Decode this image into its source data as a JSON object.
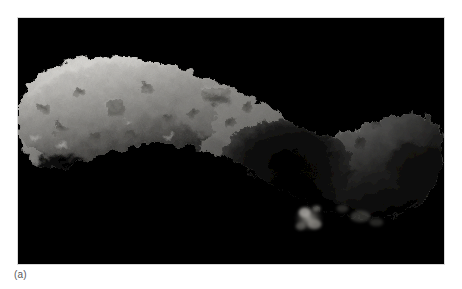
{
  "figure": {
    "caption_label": "(a)",
    "frame": {
      "x": 17,
      "y": 17,
      "width": 428,
      "height": 248,
      "background_color": "#000000",
      "border_color": "#d9d9d9"
    },
    "colors": {
      "page_background": "#ffffff",
      "space_background": "#000000",
      "caption_text": "#58585a",
      "regolith_bright": "#d8d6d2",
      "regolith_midtone": "#9a9894",
      "regolith_shadow": "#3a3937",
      "crater_rim_highlight": "#efeeea",
      "terminator_dark": "#0a0a0a"
    },
    "body_outline": {
      "description": "Elongated peanut shape spanning nearly the full frame width, widest at left, tapering and bending through a central saddle, rounded lobe at right",
      "leftmost_x": 0,
      "rightmost_x": 428,
      "top_y": 38,
      "bottom_y": 200
    },
    "features": [
      {
        "name": "large-crater-right-lobe",
        "cx": 405,
        "cy": 155,
        "r": 30
      },
      {
        "name": "rimmed-crater-upper-middle",
        "cx": 198,
        "cy": 78,
        "r": 14
      },
      {
        "name": "crater-left-lobe",
        "cx": 98,
        "cy": 92,
        "r": 11
      },
      {
        "name": "bright-patch-left-limb",
        "cx": 44,
        "cy": 128,
        "r": 8
      },
      {
        "name": "central-saddle-shadow",
        "cx": 270,
        "cy": 150,
        "r": 46
      },
      {
        "name": "detached-lit-knob",
        "cx": 292,
        "cy": 200,
        "r": 14
      }
    ],
    "lighting": {
      "direction": "from upper left",
      "terminator": "lower and right edges fall into deep shadow"
    }
  }
}
